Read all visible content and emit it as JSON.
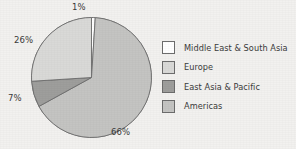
{
  "chart_data": {
    "type": "pie",
    "title": "",
    "subtitle": "",
    "xlabel": "",
    "ylabel": "",
    "legend_position": "right",
    "grid": false,
    "categories": [
      "Middle East & South Asia",
      "Europe",
      "East Asia & Pacific",
      "Americas"
    ],
    "values": [
      1,
      26,
      7,
      66
    ],
    "value_labels": [
      "1%",
      "26%",
      "7%",
      "66%"
    ],
    "colors": [
      "#ffffff",
      "#d9d9d7",
      "#9e9e9c",
      "#c4c4c2"
    ],
    "slices": [
      {
        "label": "Middle East & South Asia",
        "value": 1,
        "value_label": "1%",
        "color": "#ffffff"
      },
      {
        "label": "Americas",
        "value": 66,
        "value_label": "66%",
        "color": "#c4c4c2"
      },
      {
        "label": "East Asia & Pacific",
        "value": 7,
        "value_label": "7%",
        "color": "#9e9e9c"
      },
      {
        "label": "Europe",
        "value": 26,
        "value_label": "26%",
        "color": "#d9d9d7"
      }
    ],
    "legend": [
      {
        "label": "Middle East & South Asia",
        "color": "#ffffff"
      },
      {
        "label": "Europe",
        "color": "#d9d9d7"
      },
      {
        "label": "East Asia & Pacific",
        "color": "#9e9e9c"
      },
      {
        "label": "Americas",
        "color": "#c4c4c2"
      }
    ],
    "annotations": [
      {
        "text": "1%",
        "position": "top"
      },
      {
        "text": "26%",
        "position": "upper-left"
      },
      {
        "text": "7%",
        "position": "left"
      },
      {
        "text": "66%",
        "position": "bottom-right"
      }
    ]
  },
  "style": {
    "background": "#f2f1ef",
    "outline_color": "#6d6d6d",
    "text_color": "#3b3b3b"
  }
}
